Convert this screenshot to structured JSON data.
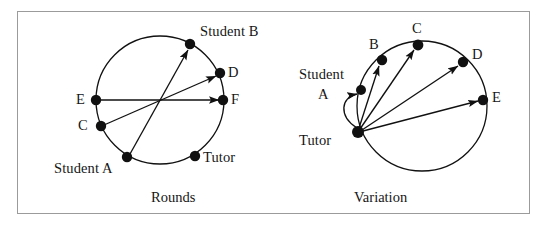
{
  "figure": {
    "border_color": "#9b9b9b",
    "ink_color": "#111111",
    "background": "#ffffff"
  },
  "panels": [
    {
      "id": "rounds",
      "caption": "Rounds",
      "caption_pos": {
        "x": 151,
        "y": 190
      },
      "circle": {
        "cx": 160,
        "cy": 100,
        "r": 64
      },
      "nodes": [
        {
          "name": "E",
          "label": "E",
          "x": 96,
          "y": 100,
          "label_x": 76,
          "label_y": 92
        },
        {
          "name": "C",
          "label": "C",
          "x": 101,
          "y": 126,
          "label_x": 78,
          "label_y": 119
        },
        {
          "name": "student-a",
          "label": "Student A",
          "x": 127,
          "y": 157,
          "label_x": 54,
          "label_y": 161
        },
        {
          "name": "tutor",
          "label": "Tutor",
          "x": 195,
          "y": 156,
          "label_x": 203,
          "label_y": 150
        },
        {
          "name": "student-b",
          "label": "Student B",
          "x": 190,
          "y": 44,
          "label_x": 200,
          "label_y": 24
        },
        {
          "name": "d",
          "label": "D",
          "x": 220,
          "y": 73,
          "label_x": 228,
          "label_y": 66
        },
        {
          "name": "f",
          "label": "F",
          "x": 223,
          "y": 100,
          "label_x": 231,
          "label_y": 93
        }
      ],
      "arrows": [
        {
          "name": "arrow-e-to-f",
          "from": "E",
          "to": "F",
          "x1": 99,
          "y1": 100,
          "x2": 219,
          "y2": 100
        },
        {
          "name": "arrow-c-to-d",
          "from": "C",
          "to": "D",
          "x1": 104,
          "y1": 125,
          "x2": 216,
          "y2": 76
        },
        {
          "name": "arrow-student-a-to-student-b",
          "from": "Student A",
          "to": "Student B",
          "x1": 130,
          "y1": 154,
          "x2": 188,
          "y2": 49
        }
      ]
    },
    {
      "id": "variation",
      "caption": "Variation",
      "caption_pos": {
        "x": 354,
        "y": 190
      },
      "circle": {
        "cx": 422,
        "cy": 106,
        "r": 65
      },
      "nodes": [
        {
          "name": "tutor",
          "label": "Tutor",
          "x": 358,
          "y": 132,
          "label_x": 299,
          "label_y": 133
        },
        {
          "name": "student-a",
          "label": "Student",
          "label2": "A",
          "x": 361,
          "y": 90,
          "label_x": 299,
          "label_y": 67,
          "label2_x": 318,
          "label2_y": 87
        },
        {
          "name": "b",
          "label": "B",
          "x": 382,
          "y": 60,
          "label_x": 369,
          "label_y": 38
        },
        {
          "name": "c",
          "label": "C",
          "x": 418,
          "y": 45,
          "label_x": 412,
          "label_y": 22
        },
        {
          "name": "d",
          "label": "D",
          "x": 463,
          "y": 62,
          "label_x": 472,
          "label_y": 48
        },
        {
          "name": "e",
          "label": "E",
          "x": 483,
          "y": 100,
          "label_x": 492,
          "label_y": 91
        }
      ],
      "arrows": [
        {
          "name": "arrow-tutor-to-student-a",
          "from": "Tutor",
          "to": "Student A",
          "curved": true,
          "path": "M 357 128 C 340 116 342 98 357 94"
        },
        {
          "name": "arrow-tutor-to-b",
          "from": "Tutor",
          "to": "B",
          "x1": 359,
          "y1": 128,
          "x2": 379,
          "y2": 65
        },
        {
          "name": "arrow-tutor-to-c",
          "from": "Tutor",
          "to": "C",
          "x1": 360,
          "y1": 129,
          "x2": 414,
          "y2": 49
        },
        {
          "name": "arrow-tutor-to-d",
          "from": "Tutor",
          "to": "D",
          "x1": 362,
          "y1": 130,
          "x2": 458,
          "y2": 65
        },
        {
          "name": "arrow-tutor-to-e",
          "from": "Tutor",
          "to": "E",
          "x1": 363,
          "y1": 131,
          "x2": 479,
          "y2": 101
        }
      ]
    }
  ]
}
